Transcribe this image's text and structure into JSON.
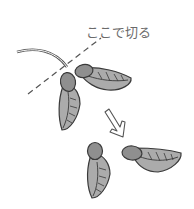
{
  "illustration": {
    "subject": "maple samara seeds being cut apart",
    "cut_label": "ここで切る",
    "colors": {
      "outline": "#3a3a3a",
      "seed_fill": "#8f8f8f",
      "wing_fill": "#ababab",
      "dash_line": "#555555",
      "label_text": "#6a6a6a",
      "background": "#ffffff"
    },
    "icons": {
      "arrow": "curved-down-right-arrow"
    }
  }
}
